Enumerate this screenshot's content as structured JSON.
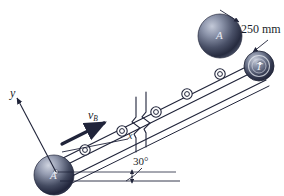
{
  "figure": {
    "background": "#ffffff",
    "line_color": "#20243a",
    "ball_color_dark": "#2a2f45",
    "ball_color_light": "#b9bfd0",
    "text_color": "#1c1f2b"
  },
  "labels": {
    "dimension": "250 mm",
    "angle": "30°",
    "velocity_symbol": "v",
    "velocity_subscript": "B",
    "axis_x": "x",
    "axis_y": "y",
    "ball_top": "A",
    "ball_bottom": "A",
    "pulley_right": "T"
  },
  "elements": {
    "roller_count": 5,
    "break_symbol": "zigzag-break",
    "arrow": "velocity-arrow",
    "dimension_arrow": "double-headed-dimension-arrow",
    "angle_arc": "angle-arc-30",
    "horizontal_reference": "horizontal-datum-line"
  }
}
